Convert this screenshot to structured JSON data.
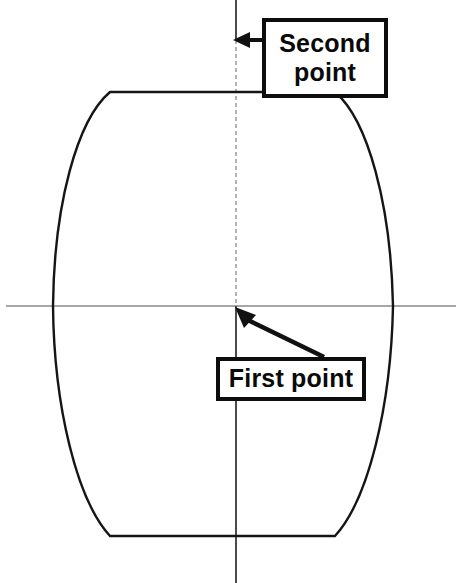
{
  "canvas": {
    "width": 462,
    "height": 583,
    "background": "#ffffff"
  },
  "colors": {
    "outline": "#151515",
    "centerline": "#8a8a8a",
    "centerline_vertical": "#6f6f6f",
    "callout_border": "#0d0d0d",
    "callout_fill": "#ffffff",
    "text": "#0a0a0a",
    "arrow": "#111111"
  },
  "callouts": [
    {
      "id": "second-point",
      "label": "Second\npoint",
      "box": {
        "x": 262,
        "y": 18,
        "width": 126,
        "height": 80
      },
      "arrow": {
        "type": "straight-left",
        "from_x": 262,
        "from_y": 40,
        "to_x": 234,
        "to_y": 40
      }
    },
    {
      "id": "first-point",
      "label": "First point",
      "box": {
        "x": 216,
        "y": 357,
        "width": 150,
        "height": 44
      },
      "arrow": {
        "type": "diagonal-up-left",
        "from_x": 322,
        "from_y": 355,
        "to_x": 237,
        "to_y": 308
      }
    }
  ],
  "centerlines": {
    "vertical": {
      "x": 236,
      "y1": 0,
      "y2": 583
    },
    "horizontal": {
      "y": 306,
      "x1": 6,
      "x2": 456
    }
  },
  "barrel": {
    "description": "barrel / cask cross-section outline",
    "top_flat": {
      "y": 92,
      "x1": 110,
      "x2": 335
    },
    "bottom_flat": {
      "y": 536,
      "x1": 110,
      "x2": 335
    },
    "max_left_x": 53,
    "max_right_x": 393,
    "waist_y": 306
  },
  "chart_data": {
    "type": "line",
    "xlabel": "",
    "ylabel": "",
    "series": [
      {
        "name": "left-profile",
        "x": [
          110,
          92,
          78,
          68,
          60,
          56,
          53,
          53,
          56,
          62,
          72,
          86,
          100,
          110
        ],
        "y": [
          92,
          112,
          140,
          175,
          215,
          258,
          300,
          320,
          362,
          405,
          446,
          484,
          515,
          536
        ]
      },
      {
        "name": "right-profile",
        "x": [
          335,
          352,
          366,
          377,
          386,
          390,
          393,
          393,
          390,
          385,
          376,
          364,
          350,
          335
        ],
        "y": [
          92,
          112,
          140,
          175,
          215,
          258,
          300,
          320,
          362,
          405,
          446,
          484,
          515,
          536
        ]
      },
      {
        "name": "top-flat",
        "x": [
          110,
          335
        ],
        "y": [
          92,
          92
        ]
      },
      {
        "name": "bottom-flat",
        "x": [
          110,
          335
        ],
        "y": [
          536,
          536
        ]
      }
    ]
  }
}
